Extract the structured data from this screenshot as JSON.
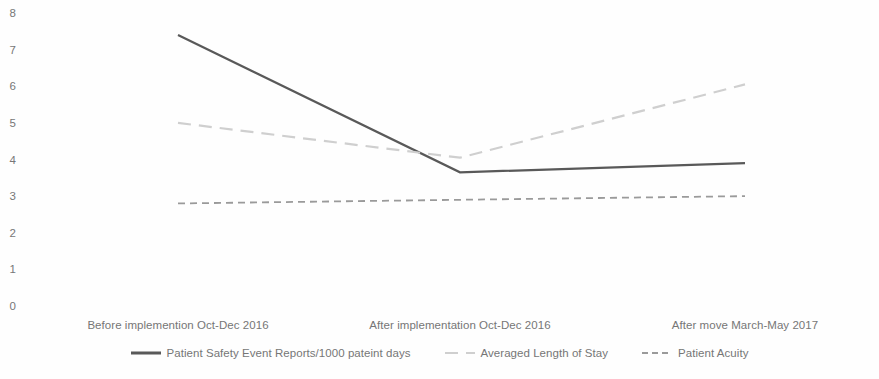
{
  "chart_data": {
    "type": "line",
    "title": "",
    "xlabel": "",
    "ylabel": "",
    "ylim": [
      0,
      8
    ],
    "yticks": [
      8,
      7,
      6,
      5,
      4,
      3,
      2,
      1,
      0
    ],
    "ytick_labels": [
      "8",
      "7",
      "6",
      "5",
      "4",
      "3",
      "2",
      "1",
      "0"
    ],
    "grid": false,
    "legend_position": "bottom",
    "categories": [
      "Before implemention Oct-Dec 2016",
      "After implementation Oct-Dec 2016",
      "After move March-May 2017"
    ],
    "series": [
      {
        "name": "Patient Safety Event Reports/1000 pateint days",
        "values": [
          7.4,
          3.65,
          3.9
        ],
        "color": "#595959",
        "style": "solid",
        "width": 2.2
      },
      {
        "name": "Averaged Length of Stay",
        "values": [
          5.0,
          4.05,
          6.05
        ],
        "color": "#cfcfcf",
        "style": "dashed",
        "width": 2.2
      },
      {
        "name": "Patient Acuity",
        "values": [
          2.8,
          2.9,
          3.0
        ],
        "color": "#9a9a9a",
        "style": "dashed",
        "width": 1.8
      }
    ]
  },
  "axis": {
    "y_labels": [
      "8",
      "7",
      "6",
      "5",
      "4",
      "3",
      "2",
      "1",
      "0"
    ],
    "x_labels": [
      "Before implemention Oct-Dec 2016",
      "After implementation Oct-Dec 2016",
      "After move March-May 2017"
    ]
  },
  "legend": {
    "items": [
      {
        "label": "Patient Safety Event Reports/1000 pateint days",
        "color": "#595959",
        "style": "solid"
      },
      {
        "label": "Averaged Length of Stay",
        "color": "#cfcfcf",
        "style": "dashed"
      },
      {
        "label": "Patient Acuity",
        "color": "#9a9a9a",
        "style": "dashed"
      }
    ]
  },
  "colors": {
    "background": "#fefefe",
    "text": "#767676",
    "series_primary": "#595959",
    "series_secondary": "#cfcfcf",
    "series_tertiary": "#9a9a9a"
  }
}
